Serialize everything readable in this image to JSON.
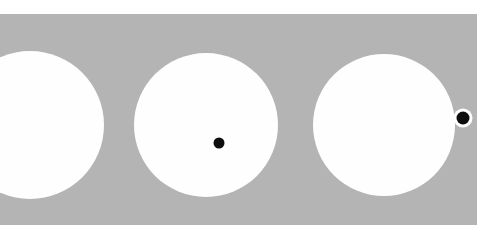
{
  "figure": {
    "canvas": {
      "width": 486,
      "height": 235,
      "background_color": "#ffffff"
    },
    "band": {
      "name": "gray-band",
      "x": 0,
      "y": 14,
      "width": 477,
      "height": 211,
      "color": "#b4b4b4"
    },
    "circles": [
      {
        "id": "circle-1",
        "label": "left circle",
        "cx": 30,
        "cy": 125,
        "r": 74,
        "color": "#fefefe",
        "clipped": "left edge"
      },
      {
        "id": "circle-2",
        "label": "middle circle",
        "cx": 206,
        "cy": 125,
        "r": 72,
        "color": "#fefefe",
        "clipped": "none"
      },
      {
        "id": "circle-3",
        "label": "right circle",
        "cx": 384,
        "cy": 125,
        "r": 71,
        "color": "#fefefe",
        "clipped": "none"
      }
    ],
    "dots": [
      {
        "id": "dot-center",
        "label": "interior dot in middle circle",
        "cx": 219,
        "cy": 143,
        "r": 5.5,
        "color": "#0d0d0d",
        "halo": false,
        "halo_r": 0,
        "halo_color": "#ffffff"
      },
      {
        "id": "dot-edge",
        "label": "edge dot on right circle boundary",
        "cx": 463,
        "cy": 118,
        "r": 6.5,
        "color": "#0d0d0d",
        "halo": true,
        "halo_r": 9.5,
        "halo_color": "#fefefe"
      }
    ]
  }
}
